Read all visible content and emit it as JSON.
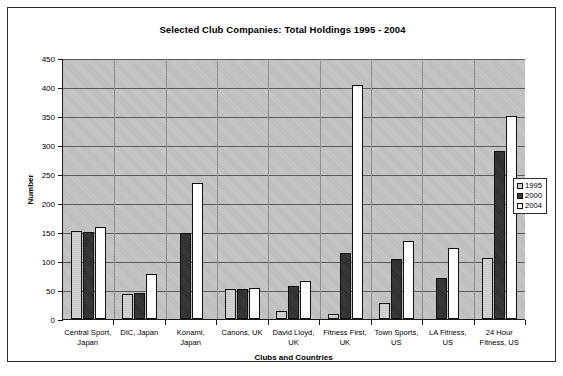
{
  "chart_data": {
    "type": "bar",
    "title": "Selected Club Companies: Total Holdings 1995 - 2004",
    "xlabel": "Clubs and Countries",
    "ylabel": "Number",
    "ylim": [
      0,
      450
    ],
    "ytick_step": 50,
    "yticks": [
      "0",
      "50",
      "100",
      "150",
      "200",
      "250",
      "300",
      "350",
      "400",
      "450"
    ],
    "grid": true,
    "legend_position": "right-middle",
    "categories": [
      "Central Sport, Japan",
      "DIC, Japan",
      "Konami, Japan",
      "Canons, UK",
      "David Lloyd, UK",
      "Fitness First, UK",
      "Town Sports, US",
      "LA Fitness, US",
      "24 Hour Fitness, US"
    ],
    "series": [
      {
        "name": "1995",
        "color": "#d0d0d0",
        "values": [
          152,
          43,
          0,
          51,
          14,
          8,
          28,
          0,
          106
        ]
      },
      {
        "name": "2000",
        "color": "#343434",
        "values": [
          150,
          45,
          148,
          52,
          57,
          114,
          103,
          70,
          290
        ]
      },
      {
        "name": "2004",
        "color": "#fdfdfd",
        "values": [
          159,
          78,
          235,
          53,
          65,
          403,
          135,
          122,
          350
        ]
      }
    ]
  },
  "legend": {
    "items": [
      {
        "label": "1995"
      },
      {
        "label": "2000"
      },
      {
        "label": "2004"
      }
    ]
  }
}
